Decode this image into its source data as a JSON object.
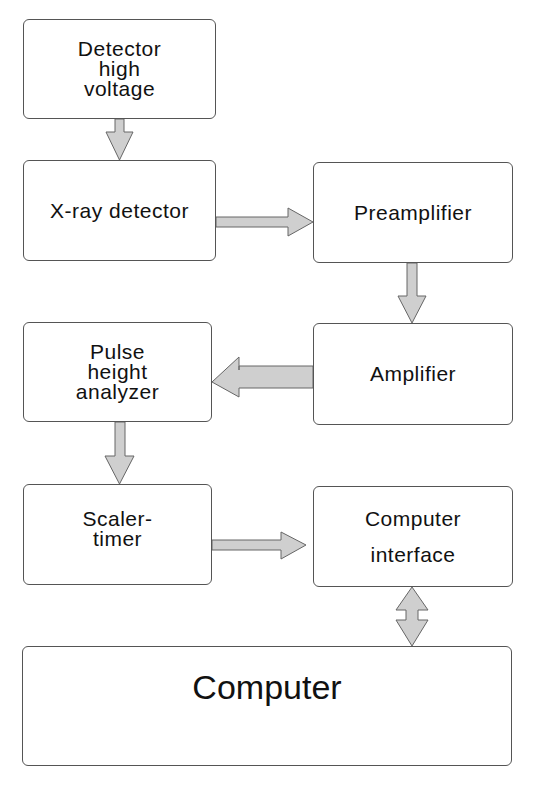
{
  "diagram": {
    "title": "",
    "arrow_fill": "#cfcfcf",
    "border_color": "#555555",
    "nodes": {
      "detector_high_voltage": {
        "lines": [
          "Detector",
          "high",
          "voltage"
        ]
      },
      "xray_detector": {
        "lines": [
          "X-ray detector"
        ]
      },
      "preamplifier": {
        "lines": [
          "Preamplifier"
        ]
      },
      "amplifier": {
        "lines": [
          "Amplifier"
        ]
      },
      "pulse_height_analyzer": {
        "lines": [
          "Pulse",
          "height",
          "analyzer"
        ]
      },
      "scaler_timer": {
        "lines": [
          "Scaler-",
          "timer"
        ]
      },
      "computer_interface": {
        "lines": [
          "Computer",
          "interface"
        ]
      },
      "computer": {
        "lines": [
          "Computer"
        ]
      }
    },
    "edges": [
      {
        "from": "Detector high voltage",
        "to": "X-ray detector",
        "direction": "down"
      },
      {
        "from": "X-ray detector",
        "to": "Preamplifier",
        "direction": "right"
      },
      {
        "from": "Preamplifier",
        "to": "Amplifier",
        "direction": "down"
      },
      {
        "from": "Amplifier",
        "to": "Pulse height analyzer",
        "direction": "left"
      },
      {
        "from": "Pulse height analyzer",
        "to": "Scaler-timer",
        "direction": "down"
      },
      {
        "from": "Scaler-timer",
        "to": "Computer interface",
        "direction": "right"
      },
      {
        "from": "Computer interface",
        "to": "Computer",
        "direction": "bidirectional"
      }
    ]
  }
}
